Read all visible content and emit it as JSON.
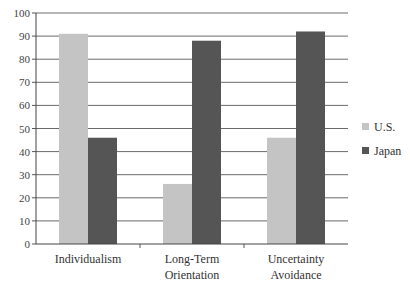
{
  "chart_data": {
    "type": "bar",
    "title": "",
    "xlabel": "",
    "ylabel": "",
    "ylim": [
      0,
      100
    ],
    "yticks": [
      0,
      10,
      20,
      30,
      40,
      50,
      60,
      70,
      80,
      90,
      100
    ],
    "grid": true,
    "legend_position": "right",
    "categories": [
      {
        "lines": [
          "Individualism"
        ]
      },
      {
        "lines": [
          "Long-Term",
          "Orientation"
        ]
      },
      {
        "lines": [
          "Uncertainty",
          "Avoidance"
        ]
      }
    ],
    "series": [
      {
        "name": "U.S.",
        "color": "#c4c4c4",
        "values": [
          91,
          26,
          46
        ]
      },
      {
        "name": "Japan",
        "color": "#555555",
        "values": [
          46,
          88,
          92
        ]
      }
    ]
  }
}
